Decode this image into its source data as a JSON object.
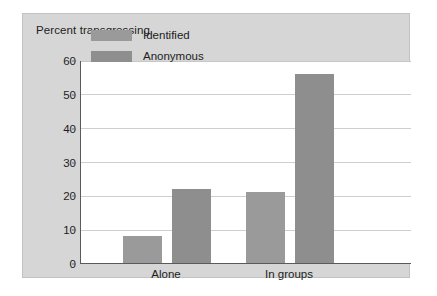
{
  "chart_data": {
    "type": "bar",
    "title": "Percent transgressing",
    "xlabel": "",
    "ylabel": "Percent transgressing",
    "categories": [
      "Alone",
      "In groups"
    ],
    "series": [
      {
        "name": "Identified",
        "values": [
          8,
          21
        ],
        "color": "#9a9a9a"
      },
      {
        "name": "Anonymous",
        "values": [
          22,
          56
        ],
        "color": "#8e8e8e"
      }
    ],
    "ylim": [
      0,
      60
    ],
    "yticks": [
      "0",
      "10",
      "20",
      "30",
      "40",
      "50",
      "60"
    ],
    "grid": true,
    "legend_position": "top-left-inside"
  },
  "legend": {
    "items": [
      {
        "label": "Identified"
      },
      {
        "label": "Anonymous"
      }
    ]
  },
  "panel": {
    "background": "#d6d6d6",
    "plot_background": "#ffffff",
    "gridline_color": "#cfcfcf",
    "axis_color": "#5a5a5a"
  }
}
